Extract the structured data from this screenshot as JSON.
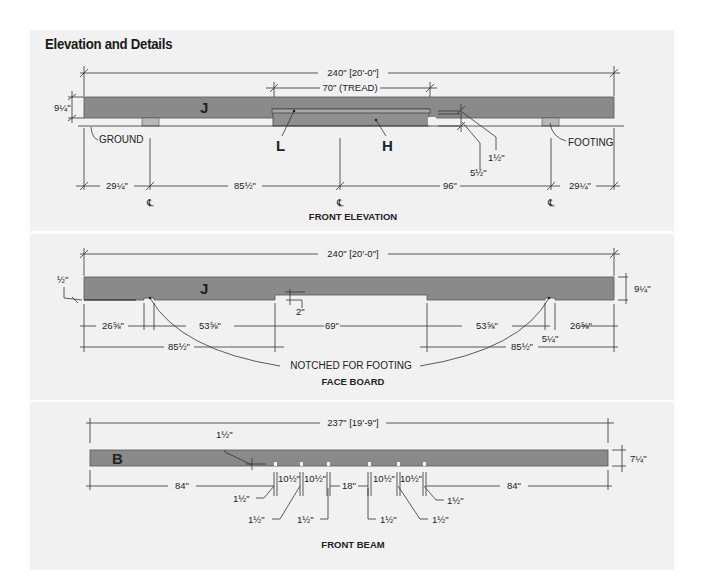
{
  "title": "Elevation and Details",
  "colors": {
    "board": "#8a8a8a",
    "panel_bg": "#f1f1f1",
    "ink": "#222222"
  },
  "front_elevation": {
    "caption": "FRONT ELEVATION",
    "overall_length": "240\" [20'-0\"]",
    "tread_length": "70\" (TREAD)",
    "board_height": "9¼\"",
    "part_face_board": "J",
    "part_tread": "L",
    "part_riser": "H",
    "ground_label": "GROUND",
    "footing_label": "FOOTING",
    "step_dims": [
      "1½\"",
      "5½\""
    ],
    "bottom_dims": [
      "29¼\"",
      "85½\"",
      "96\"",
      "29¼\""
    ],
    "centerline_symbol": "℄"
  },
  "face_board": {
    "caption": "FACE BOARD",
    "overall_length": "240\" [20'-0\"]",
    "part": "J",
    "board_height": "9¼\"",
    "left_offset": "½\"",
    "notch_depth": "2\"",
    "row1_dims": [
      "26⅝\"",
      "53⅝\"",
      "69\"",
      "53⅝\"",
      "26⅝\""
    ],
    "notch_width": "5¼\"",
    "row2_dims": [
      "85½\"",
      "85½\""
    ],
    "note": "NOTCHED FOR FOOTING"
  },
  "front_beam": {
    "caption": "FRONT BEAM",
    "overall_length": "237\" [19'-9\"]",
    "part": "B",
    "beam_height": "7¼\"",
    "slot_width_top": "1½\"",
    "main_dims": [
      "84\"",
      "10½\"",
      "10½\"",
      "18\"",
      "10½\"",
      "10½\"",
      "84\""
    ],
    "slot_dims": [
      "1½\"",
      "1½\"",
      "1½\"",
      "1½\"",
      "1½\"",
      "1½\""
    ]
  }
}
